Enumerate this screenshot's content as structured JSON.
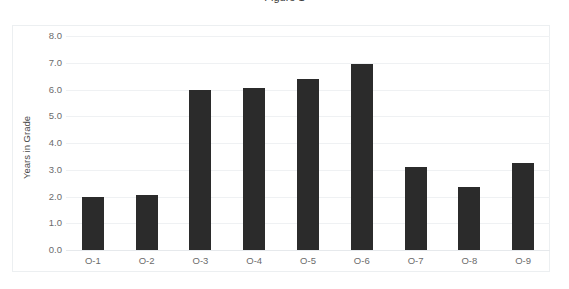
{
  "chart_data": {
    "type": "bar",
    "title": "",
    "xlabel": "",
    "ylabel": "Years in Grade",
    "categories": [
      "O-1",
      "O-2",
      "O-3",
      "O-4",
      "O-5",
      "O-6",
      "O-7",
      "O-8",
      "O-9"
    ],
    "values": [
      2.0,
      2.05,
      6.0,
      6.05,
      6.4,
      6.95,
      3.1,
      2.35,
      3.25
    ],
    "ylim": [
      0.0,
      8.0
    ],
    "ytick_labels": [
      "8.0",
      "7.0",
      "6.0",
      "5.0",
      "4.0",
      "3.0",
      "2.0",
      "1.0",
      "0.0"
    ],
    "ytick_values": [
      8.0,
      7.0,
      6.0,
      5.0,
      4.0,
      3.0,
      2.0,
      1.0,
      0.0
    ],
    "grid": true,
    "legend": false,
    "bar_color": "#2b2b2b",
    "gridline_color": "#eff1f3",
    "axis_text_color": "#6b6b6b",
    "frame_color": "#eceff1"
  },
  "title_fragment": "Figure 1"
}
